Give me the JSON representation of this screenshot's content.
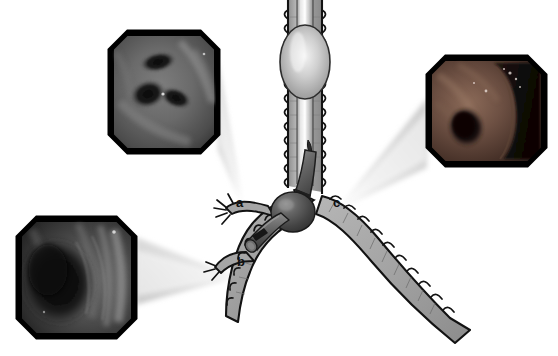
{
  "figure": {
    "kind": "medical-illustration",
    "background_color": "#ffffff",
    "airway_fill": "#a8a8a8",
    "airway_outline": "#1a1a1a",
    "device_color": "#4a4a4a",
    "label_color": "#111111",
    "cone_color": "#d8d8d8"
  },
  "callouts": [
    {
      "id": "a",
      "label": "a",
      "x": 236,
      "y": 196,
      "target": "upper-left-bronchus-segment",
      "inset": "inset-a"
    },
    {
      "id": "b",
      "label": "b",
      "x": 237,
      "y": 255,
      "target": "lower-left-bronchus-segment",
      "inset": "inset-b"
    },
    {
      "id": "c",
      "label": "c",
      "x": 333,
      "y": 196,
      "target": "right-main-bronchus-orifice",
      "inset": "inset-c"
    }
  ],
  "insets": [
    {
      "id": "inset-a",
      "name": "endoscopic-image-a",
      "position": "top-left",
      "x": 110,
      "y": 32,
      "width": 108,
      "height": 120,
      "tone": "#6a6a6a",
      "description": "Bronchoscopic view of bifurcating airway lumen with two dark segmental orifices"
    },
    {
      "id": "inset-b",
      "name": "endoscopic-image-b",
      "position": "bottom-left",
      "x": 18,
      "y": 218,
      "width": 117,
      "height": 119,
      "tone": "#4a4a4a",
      "description": "Dark bronchoscopic view of a narrowed airway lumen"
    },
    {
      "id": "inset-c",
      "name": "endoscopic-image-c",
      "position": "right",
      "x": 428,
      "y": 57,
      "width": 117,
      "height": 108,
      "tone": "#7a5a4a",
      "description": "Bronchoscopic view showing dark lesion adjacent to mucosal wall"
    }
  ],
  "anatomy": {
    "trachea": "trachea-with-cartilage-rings",
    "left_bronchus": "left-main-bronchus",
    "right_bronchus": "right-main-bronchus",
    "carina": "carina"
  },
  "device": {
    "name": "endobronchial-valve-with-balloon",
    "balloon": "inflated-balloon-cuff",
    "catheter": "bronchoscope-catheter",
    "stent": "cylindrical-stent"
  }
}
